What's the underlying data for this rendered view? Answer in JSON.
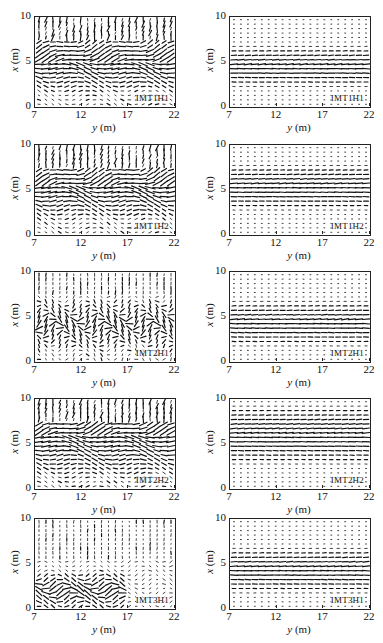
{
  "figure": {
    "axis_labels": {
      "x_var": "y",
      "x_unit": " (m)",
      "y_var": "x",
      "y_unit": " (m)"
    },
    "x_ticks": [
      "7",
      "12",
      "17",
      "22"
    ],
    "y_ticks": [
      "0",
      "5",
      "10"
    ]
  },
  "chart_data": [
    {
      "id": "L1",
      "type": "quiver",
      "label": "IMT1H1",
      "column": "left",
      "row": 1,
      "xlabel": "y (m)",
      "ylabel": "x (m)",
      "xlim": [
        7,
        22
      ],
      "ylim": [
        0,
        10
      ],
      "pattern": "turbulent-band",
      "band_center": 5,
      "band_width": 3.5,
      "chaos": 0.55,
      "mag": 1.0
    },
    {
      "id": "R1",
      "type": "quiver",
      "label": "IMT1H1",
      "column": "right",
      "row": 1,
      "xlabel": "y (m)",
      "ylabel": "x (m)",
      "xlim": [
        7,
        22
      ],
      "ylim": [
        0,
        10
      ],
      "pattern": "uniform-band",
      "band_center": 4.5,
      "band_width": 2.6,
      "chaos": 0.08,
      "mag": 1.0
    },
    {
      "id": "L2",
      "type": "quiver",
      "label": "IMT1H2",
      "column": "left",
      "row": 2,
      "xlabel": "y (m)",
      "ylabel": "x (m)",
      "xlim": [
        7,
        22
      ],
      "ylim": [
        0,
        10
      ],
      "pattern": "turbulent-band",
      "band_center": 5.3,
      "band_width": 3.8,
      "chaos": 0.6,
      "mag": 1.0
    },
    {
      "id": "R2",
      "type": "quiver",
      "label": "IMT1H2",
      "column": "right",
      "row": 2,
      "xlabel": "y (m)",
      "ylabel": "x (m)",
      "xlim": [
        7,
        22
      ],
      "ylim": [
        0,
        10
      ],
      "pattern": "uniform-band",
      "band_center": 5.3,
      "band_width": 2.8,
      "chaos": 0.08,
      "mag": 1.0
    },
    {
      "id": "L3",
      "type": "quiver",
      "label": "IMT2H1",
      "column": "left",
      "row": 3,
      "xlabel": "y (m)",
      "ylabel": "x (m)",
      "xlim": [
        7,
        22
      ],
      "ylim": [
        0,
        10
      ],
      "pattern": "vortical",
      "band_center": 4.2,
      "band_width": 3.0,
      "chaos": 0.95,
      "mag": 0.9
    },
    {
      "id": "R3",
      "type": "quiver",
      "label": "IMT2H1",
      "column": "right",
      "row": 3,
      "xlabel": "y (m)",
      "ylabel": "x (m)",
      "xlim": [
        7,
        22
      ],
      "ylim": [
        0,
        10
      ],
      "pattern": "uniform-band",
      "band_center": 4.3,
      "band_width": 2.8,
      "chaos": 0.1,
      "mag": 1.0
    },
    {
      "id": "L4",
      "type": "quiver",
      "label": "IMT2H2",
      "column": "left",
      "row": 4,
      "xlabel": "y (m)",
      "ylabel": "x (m)",
      "xlim": [
        7,
        22
      ],
      "ylim": [
        0,
        10
      ],
      "pattern": "turbulent-band",
      "band_center": 5.8,
      "band_width": 4.6,
      "chaos": 0.55,
      "mag": 1.0
    },
    {
      "id": "R4",
      "type": "quiver",
      "label": "IMT2H2",
      "column": "right",
      "row": 4,
      "xlabel": "y (m)",
      "ylabel": "x (m)",
      "xlim": [
        7,
        22
      ],
      "ylim": [
        0,
        10
      ],
      "pattern": "uniform-band",
      "band_center": 6.0,
      "band_width": 3.6,
      "chaos": 0.08,
      "mag": 1.0
    },
    {
      "id": "L5",
      "type": "quiver",
      "label": "IMT3H1",
      "column": "left",
      "row": 5,
      "xlabel": "y (m)",
      "ylabel": "x (m)",
      "xlim": [
        7,
        22
      ],
      "ylim": [
        0,
        10
      ],
      "pattern": "low-vortical",
      "band_center": 2.0,
      "band_width": 2.5,
      "chaos": 0.85,
      "mag": 1.0
    },
    {
      "id": "R5",
      "type": "quiver",
      "label": "IMT3H1",
      "column": "right",
      "row": 5,
      "xlabel": "y (m)",
      "ylabel": "x (m)",
      "xlim": [
        7,
        22
      ],
      "ylim": [
        0,
        10
      ],
      "pattern": "uniform-band",
      "band_center": 4.3,
      "band_width": 2.8,
      "chaos": 0.08,
      "mag": 1.0
    }
  ]
}
